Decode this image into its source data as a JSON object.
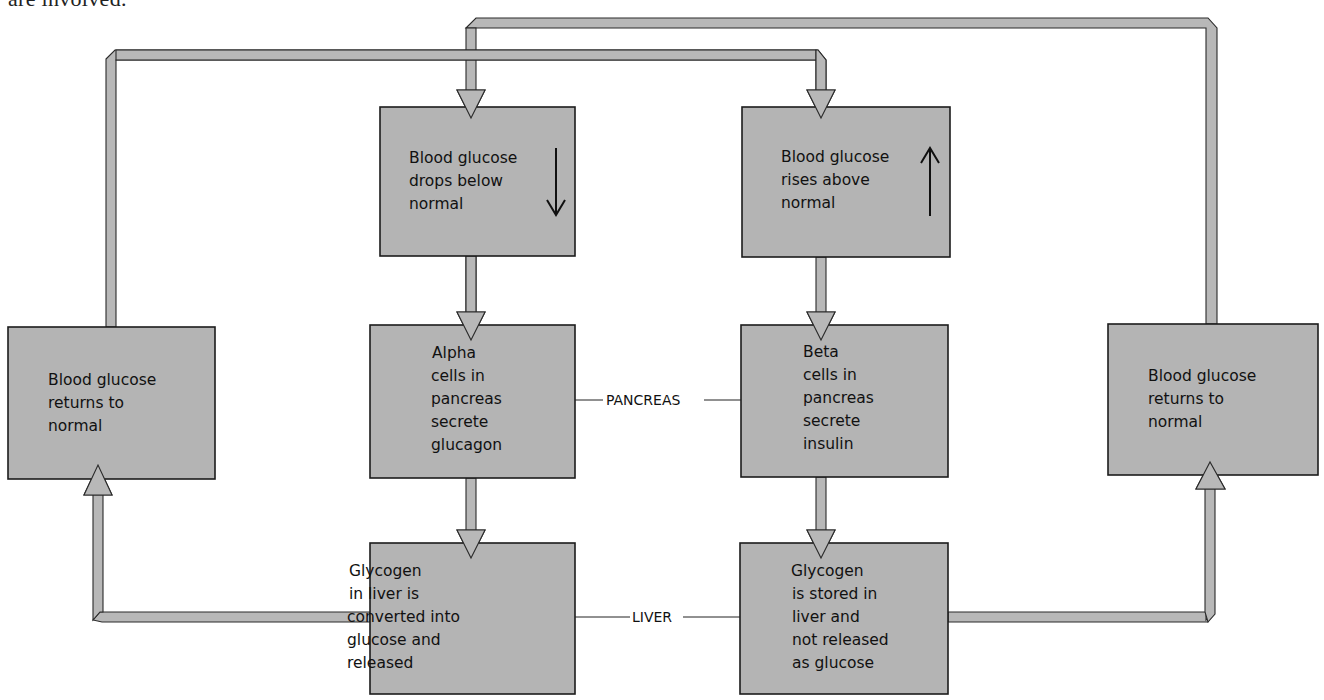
{
  "caption": "are involved.",
  "boxes": {
    "drop": {
      "lines": [
        "Blood glucose",
        "drops below",
        "normal"
      ],
      "indicator": "down-arrow"
    },
    "rise": {
      "lines": [
        "Blood glucose",
        "rises above",
        "normal"
      ],
      "indicator": "up-arrow"
    },
    "alpha": {
      "lines": [
        "Alpha",
        "cells in",
        "pancreas",
        "secrete",
        "glucagon"
      ]
    },
    "beta": {
      "lines": [
        "Beta",
        "cells in",
        "pancreas",
        "secrete",
        "insulin"
      ]
    },
    "liver_release": {
      "lines": [
        "Glycogen",
        "in liver is",
        "converted  into",
        "glucose and",
        "released"
      ]
    },
    "liver_store": {
      "lines": [
        "Glycogen",
        "is stored in",
        "liver and",
        "not released",
        "as glucose"
      ]
    },
    "return_left": {
      "lines": [
        "Blood glucose",
        "returns to",
        "normal"
      ]
    },
    "return_right": {
      "lines": [
        "Blood glucose",
        "returns to",
        "normal"
      ]
    }
  },
  "labels": {
    "pancreas": "PANCREAS",
    "liver": "LIVER"
  },
  "colors": {
    "box_fill": "#b4b4b4",
    "pipe_fill": "#b8b8b8",
    "outline": "#1c1c1c"
  }
}
